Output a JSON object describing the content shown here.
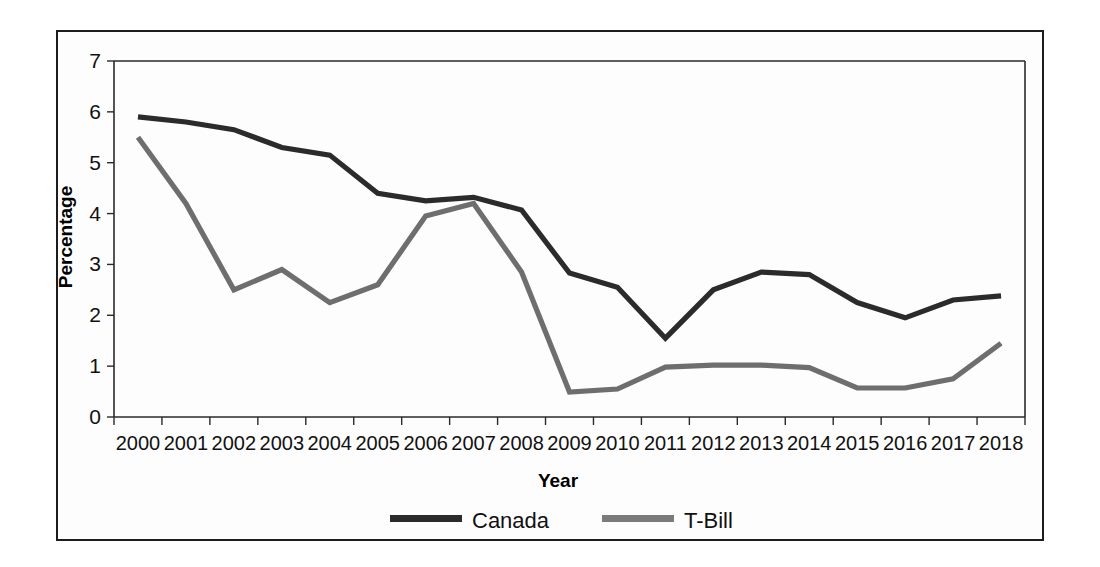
{
  "chart_data": {
    "type": "line",
    "title": "",
    "xlabel": "Year",
    "ylabel": "Percentage",
    "categories": [
      "2000",
      "2001",
      "2002",
      "2003",
      "2004",
      "2005",
      "2006",
      "2007",
      "2008",
      "2009",
      "2010",
      "2011",
      "2012",
      "2013",
      "2014",
      "2015",
      "2016",
      "2017",
      "2018"
    ],
    "ylim": [
      0,
      7
    ],
    "yticks": [
      0,
      1,
      2,
      3,
      4,
      5,
      6,
      7
    ],
    "grid": false,
    "legend_position": "bottom",
    "series": [
      {
        "name": "Canada",
        "color": "#2b2b2b",
        "values": [
          5.9,
          5.8,
          5.65,
          5.3,
          5.15,
          4.4,
          4.25,
          4.32,
          4.07,
          2.83,
          2.55,
          1.55,
          2.5,
          2.85,
          2.8,
          2.25,
          1.95,
          2.3,
          2.38
        ]
      },
      {
        "name": "T-Bill",
        "color": "#7b7b7b",
        "values": [
          5.5,
          4.2,
          2.5,
          2.9,
          2.25,
          2.6,
          3.95,
          4.2,
          2.85,
          0.49,
          0.55,
          0.98,
          1.02,
          1.02,
          0.97,
          0.57,
          0.57,
          0.75,
          1.45
        ]
      }
    ]
  },
  "legend": {
    "items": [
      {
        "label": "Canada",
        "color": "#2b2b2b"
      },
      {
        "label": "T-Bill",
        "color": "#7b7b7b"
      }
    ]
  },
  "axes": {
    "x_title": "Year",
    "y_title": "Percentage"
  }
}
